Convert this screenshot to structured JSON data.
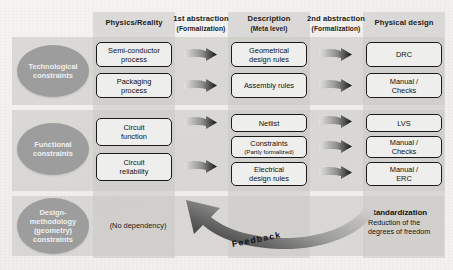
{
  "diagram": {
    "columns": [
      {
        "id": "physics",
        "label": "Physics/Reality",
        "sub": ""
      },
      {
        "id": "abs1",
        "label": "1st abstraction",
        "sub": "(Formalization)"
      },
      {
        "id": "description",
        "label": "Description",
        "sub": "(Meta level)"
      },
      {
        "id": "abs2",
        "label": "2nd abstraction",
        "sub": "(Formalization)"
      },
      {
        "id": "physical",
        "label": "Physical design",
        "sub": ""
      }
    ],
    "rows": [
      {
        "id": "technological",
        "ellipse": "Technological constraints",
        "physics": [
          "Semi-conductor process",
          "Packaging process"
        ],
        "description": [
          "Geometrical design rules",
          "Assembly rules"
        ],
        "physical": [
          "DRC",
          "Manual / Checks"
        ]
      },
      {
        "id": "functional",
        "ellipse": "Functional constraints",
        "physics": [
          "Circuit function",
          "Circuit reliability"
        ],
        "description": [
          "Netlist",
          "Constraints",
          "Electrical design rules"
        ],
        "description_sub": "(Partly formalized)",
        "physical": [
          "LVS",
          "Manual / Checks",
          "Manual / ERC"
        ]
      },
      {
        "id": "design_methodology",
        "ellipse": "Design- methodology (geometry) constraints",
        "no_dependency": "(No dependency)",
        "standardization_title": "Standardization",
        "standardization_desc": "Reduction of the degrees of freedom"
      }
    ],
    "feedback_label": "Feedback",
    "cells": {
      "r1c1a": "Semi-conductor",
      "r1c1a2": "process",
      "r1c1b": "Packaging",
      "r1c1b2": "process",
      "r1c3a": "Geometrical",
      "r1c3a2": "design rules",
      "r1c3b": "Assembly rules",
      "r1c5a": "DRC",
      "r1c5b": "Manual /",
      "r1c5b2": "Checks",
      "r2c1a": "Circuit",
      "r2c1a2": "function",
      "r2c1b": "Circuit",
      "r2c1b2": "reliability",
      "r2c3a": "Netlist",
      "r2c3b": "Constraints",
      "r2c3bsub": "(Partly formalized)",
      "r2c3c": "Electrical",
      "r2c3c2": "design rules",
      "r2c5a": "LVS",
      "r2c5b": "Manual /",
      "r2c5b2": "Checks",
      "r2c5c": "Manual /",
      "r2c5c2": "ERC",
      "r3c1": "(No dependency)",
      "r3c5t": "Standardization",
      "r3c5d1": "Reduction of the",
      "r3c5d2": "degrees of freedom"
    },
    "ellipse_lines": {
      "e1l1": "Technological",
      "e1l2": "constraints",
      "e2l1": "Functional",
      "e2l2": "constraints",
      "e3l1": "Design-",
      "e3l2": "methodology",
      "e3l3": "(geometry)",
      "e3l4": "constraints"
    },
    "headers": {
      "h1": "Physics/Reality",
      "h2": "1st abstraction",
      "h2s": "(Formalization)",
      "h3": "Description",
      "h3s": "(Meta level)",
      "h4": "2nd abstraction",
      "h4s": "(Formalization)",
      "h5": "Physical design"
    },
    "colors": {
      "band": "#c8c7c4",
      "ellipse": "#9d9d9d",
      "box_fill": "#eeeeec",
      "box_stroke": "#1b1b1b",
      "arrow_dark": "#1a1a1a",
      "arrow_light": "#dddddc",
      "page_bg": "#f4f3f1"
    }
  }
}
